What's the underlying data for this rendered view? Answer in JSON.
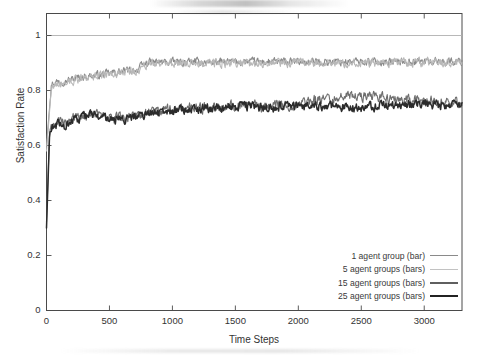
{
  "chart_data": {
    "type": "line",
    "title": "",
    "xlabel": "Time Steps",
    "ylabel": "Satisfaction Rate",
    "xlim": [
      0,
      3300
    ],
    "ylim": [
      0,
      1.08
    ],
    "xticks": [
      0,
      500,
      1000,
      1500,
      2000,
      2500,
      3000
    ],
    "xticklabels": [
      "0",
      "500",
      "1000",
      "1500",
      "2000",
      "2500",
      "3000"
    ],
    "yticks": [
      0,
      0.2,
      0.4,
      0.6,
      0.8,
      1
    ],
    "yticklabels": [
      "0",
      "0.2",
      "0.4",
      "0.6",
      "0.8",
      "1"
    ],
    "grid": false,
    "gridline_at_y": 1,
    "legend_position": "lower right",
    "series": [
      {
        "name": "1 agent group (bar)",
        "color": "#8a8a8a",
        "linewidth": 1.1,
        "noise": 0.012,
        "x": [
          0,
          40,
          80,
          130,
          180,
          240,
          300,
          360,
          420,
          500,
          580,
          650,
          720,
          800,
          840,
          900,
          1000,
          1100,
          1250,
          1400,
          1550,
          1700,
          1850,
          2000,
          2150,
          2300,
          2450,
          2600,
          2750,
          2900,
          3050,
          3200,
          3300
        ],
        "y": [
          0.6,
          0.825,
          0.832,
          0.836,
          0.838,
          0.845,
          0.851,
          0.854,
          0.856,
          0.862,
          0.868,
          0.872,
          0.876,
          0.902,
          0.903,
          0.903,
          0.903,
          0.903,
          0.903,
          0.903,
          0.904,
          0.904,
          0.904,
          0.904,
          0.904,
          0.905,
          0.905,
          0.905,
          0.905,
          0.906,
          0.906,
          0.906,
          0.906
        ]
      },
      {
        "name": "5 agent groups (bars)",
        "color": "#b9b9b9",
        "linewidth": 1.1,
        "noise": 0.014,
        "x": [
          0,
          40,
          80,
          130,
          180,
          240,
          300,
          360,
          420,
          500,
          580,
          650,
          720,
          800,
          840,
          900,
          1000,
          1100,
          1250,
          1400,
          1550,
          1700,
          1850,
          2000,
          2150,
          2300,
          2450,
          2600,
          2750,
          2900,
          3050,
          3200,
          3300
        ],
        "y": [
          0.58,
          0.818,
          0.826,
          0.83,
          0.833,
          0.84,
          0.846,
          0.85,
          0.852,
          0.858,
          0.864,
          0.869,
          0.873,
          0.898,
          0.899,
          0.899,
          0.9,
          0.9,
          0.9,
          0.9,
          0.9,
          0.901,
          0.901,
          0.901,
          0.901,
          0.902,
          0.902,
          0.902,
          0.902,
          0.903,
          0.903,
          0.903,
          0.903
        ]
      },
      {
        "name": "15 agent groups (bars)",
        "color": "#6e6e6e",
        "linewidth": 1.1,
        "noise": 0.016,
        "x": [
          0,
          25,
          60,
          100,
          150,
          200,
          260,
          320,
          380,
          440,
          520,
          600,
          680,
          760,
          850,
          950,
          1050,
          1150,
          1300,
          1450,
          1600,
          1750,
          1900,
          2000,
          2100,
          2200,
          2300,
          2400,
          2500,
          2600,
          2700,
          2800,
          2950,
          3100,
          3250,
          3300
        ],
        "y": [
          0.32,
          0.655,
          0.672,
          0.69,
          0.678,
          0.695,
          0.704,
          0.712,
          0.716,
          0.706,
          0.698,
          0.7,
          0.708,
          0.716,
          0.722,
          0.728,
          0.733,
          0.737,
          0.74,
          0.744,
          0.747,
          0.742,
          0.748,
          0.752,
          0.764,
          0.772,
          0.774,
          0.78,
          0.776,
          0.782,
          0.77,
          0.766,
          0.762,
          0.76,
          0.758,
          0.757
        ]
      },
      {
        "name": "25 agent groups (bars)",
        "color": "#2b2b2b",
        "linewidth": 1.5,
        "noise": 0.014,
        "x": [
          0,
          25,
          60,
          100,
          150,
          200,
          260,
          320,
          380,
          440,
          520,
          600,
          680,
          760,
          850,
          950,
          1050,
          1150,
          1300,
          1450,
          1600,
          1750,
          1900,
          2000,
          2100,
          2200,
          2300,
          2400,
          2500,
          2600,
          2700,
          2800,
          2950,
          3100,
          3250,
          3300
        ],
        "y": [
          0.3,
          0.648,
          0.664,
          0.683,
          0.67,
          0.688,
          0.698,
          0.708,
          0.712,
          0.7,
          0.692,
          0.694,
          0.702,
          0.71,
          0.717,
          0.723,
          0.729,
          0.733,
          0.737,
          0.74,
          0.743,
          0.736,
          0.742,
          0.745,
          0.74,
          0.742,
          0.739,
          0.741,
          0.738,
          0.742,
          0.745,
          0.748,
          0.75,
          0.748,
          0.746,
          0.745
        ]
      }
    ]
  },
  "legend": {
    "items": [
      {
        "label": "1 agent group (bar)"
      },
      {
        "label": "5 agent groups (bars)"
      },
      {
        "label": "15 agent groups (bars)"
      },
      {
        "label": "25 agent groups (bars)"
      }
    ]
  },
  "colors": {
    "background": "#ffffff",
    "axis": "#4a4a4a",
    "gridline": "#b0b0b0",
    "text": "#333333"
  }
}
